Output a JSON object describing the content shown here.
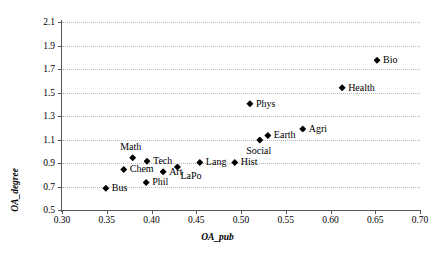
{
  "chart_data": {
    "type": "scatter",
    "title": "",
    "xlabel": "OA_pub",
    "ylabel": "OA_degree",
    "xlim": [
      0.3,
      0.7
    ],
    "ylim": [
      0.5,
      2.1
    ],
    "xticks": [
      "0.30",
      "0.35",
      "0.40",
      "0.45",
      "0.50",
      "0.55",
      "0.60",
      "0.65",
      "0.70"
    ],
    "yticks": [
      "0.5",
      "0.7",
      "0.9",
      "1.1",
      "1.3",
      "1.5",
      "1.7",
      "1.9",
      "2.1"
    ],
    "grid": "horizontal-dotted",
    "legend": "none",
    "marker_style": "filled-diamond",
    "marker_color": "#000000",
    "points": [
      {
        "label": "Bus",
        "x": 0.349,
        "y": 0.685,
        "label_pos": "right"
      },
      {
        "label": "Chem",
        "x": 0.369,
        "y": 0.845,
        "label_pos": "right"
      },
      {
        "label": "Math",
        "x": 0.379,
        "y": 0.945,
        "label_pos": "above"
      },
      {
        "label": "Tech",
        "x": 0.395,
        "y": 0.915,
        "label_pos": "right"
      },
      {
        "label": "Phil",
        "x": 0.394,
        "y": 0.735,
        "label_pos": "right"
      },
      {
        "label": "Art",
        "x": 0.413,
        "y": 0.825,
        "label_pos": "right"
      },
      {
        "label": "LaPo",
        "x": 0.429,
        "y": 0.865,
        "label_pos": "below-right"
      },
      {
        "label": "Lang",
        "x": 0.454,
        "y": 0.905,
        "label_pos": "right"
      },
      {
        "label": "Hist",
        "x": 0.493,
        "y": 0.905,
        "label_pos": "right"
      },
      {
        "label": "Phys",
        "x": 0.51,
        "y": 1.405,
        "label_pos": "right"
      },
      {
        "label": "Social",
        "x": 0.521,
        "y": 1.095,
        "label_pos": "below"
      },
      {
        "label": "Earth",
        "x": 0.53,
        "y": 1.135,
        "label_pos": "right"
      },
      {
        "label": "Agri",
        "x": 0.569,
        "y": 1.19,
        "label_pos": "right"
      },
      {
        "label": "Health",
        "x": 0.613,
        "y": 1.54,
        "label_pos": "right"
      },
      {
        "label": "Bio",
        "x": 0.652,
        "y": 1.775,
        "label_pos": "right"
      }
    ]
  }
}
